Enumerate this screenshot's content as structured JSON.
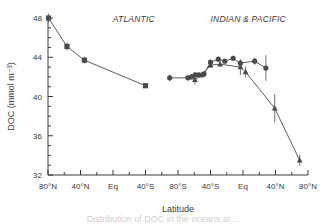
{
  "figure": {
    "background": "#ffffff",
    "ink": "#3a3a3a",
    "marker_color": "#4a4a4a",
    "caption_partial": "Distribution of DOC in the oceans at ..."
  },
  "chart_data": {
    "type": "line",
    "title": "",
    "xlabel": "Latitude",
    "ylabel": "DOC (mmol m⁻³)",
    "ylim": [
      32,
      48
    ],
    "yticks": [
      32,
      36,
      40,
      44,
      48
    ],
    "ytick_minor_step": 1,
    "grid": false,
    "legend_position": "none",
    "annotations": [
      {
        "text": "ATLANTIC",
        "x_frac": 0.33,
        "y_value": 47.6,
        "style": "italic"
      },
      {
        "text": "INDIAN & PACIFIC",
        "x_frac": 0.77,
        "y_value": 47.6,
        "style": "italic"
      }
    ],
    "xaxis": {
      "type": "categorical-transect",
      "tick_labels": [
        "80°N",
        "40°N",
        "Eq",
        "40°S",
        "80°S",
        "40°S",
        "Eq",
        "40°N",
        "80°N"
      ],
      "tick_fracs": [
        0.0,
        0.125,
        0.25,
        0.375,
        0.5,
        0.625,
        0.75,
        0.875,
        1.0
      ],
      "minor_ticks_between": 1
    },
    "series": [
      {
        "name": "Atlantic transect",
        "marker": "square",
        "connected": true,
        "points": [
          {
            "x_frac": 0.002,
            "y": 48.0,
            "err": 0.45
          },
          {
            "x_frac": 0.073,
            "y": 45.1,
            "err": 0.4
          },
          {
            "x_frac": 0.14,
            "y": 43.7,
            "err": 0.35
          },
          {
            "x_frac": 0.375,
            "y": 41.1,
            "err": 0.12
          }
        ]
      },
      {
        "name": "Indian & Pacific transect (circles)",
        "marker": "circle",
        "connected": true,
        "points": [
          {
            "x_frac": 0.468,
            "y": 41.9,
            "err": 0.35
          },
          {
            "x_frac": 0.538,
            "y": 41.9,
            "err": 0.3
          },
          {
            "x_frac": 0.552,
            "y": 42.0,
            "err": 0.25
          },
          {
            "x_frac": 0.566,
            "y": 42.2,
            "err": 0.25
          },
          {
            "x_frac": 0.58,
            "y": 42.2,
            "err": 0.2
          },
          {
            "x_frac": 0.6,
            "y": 42.3,
            "err": 0.25
          },
          {
            "x_frac": 0.625,
            "y": 43.5,
            "err": 0.2
          },
          {
            "x_frac": 0.655,
            "y": 43.8,
            "err": 0.25
          },
          {
            "x_frac": 0.68,
            "y": 43.6,
            "err": 0.2
          },
          {
            "x_frac": 0.712,
            "y": 43.9,
            "err": 0.25
          },
          {
            "x_frac": 0.74,
            "y": 43.4,
            "err": 0.3
          },
          {
            "x_frac": 0.795,
            "y": 43.6,
            "err": 0.35
          },
          {
            "x_frac": 0.838,
            "y": 42.9,
            "err": 1.3
          }
        ]
      },
      {
        "name": "Indian & Pacific transect (triangles)",
        "marker": "triangle",
        "connected": true,
        "points": [
          {
            "x_frac": 0.565,
            "y": 41.7,
            "err": 0.45
          },
          {
            "x_frac": 0.592,
            "y": 42.2,
            "err": 0.3
          },
          {
            "x_frac": 0.625,
            "y": 43.2,
            "err": 0.3
          },
          {
            "x_frac": 0.662,
            "y": 43.3,
            "err": 0.25
          },
          {
            "x_frac": 0.74,
            "y": 43.0,
            "err": 0.8
          },
          {
            "x_frac": 0.76,
            "y": 42.5,
            "err": 0.55
          },
          {
            "x_frac": 0.872,
            "y": 38.8,
            "err": 1.45
          },
          {
            "x_frac": 0.968,
            "y": 33.5,
            "err": 0.55
          }
        ]
      }
    ]
  }
}
